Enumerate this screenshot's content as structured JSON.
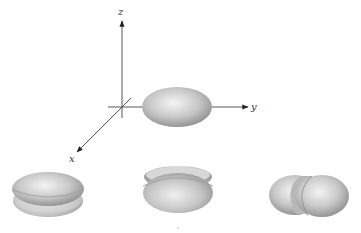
{
  "diagram": {
    "type": "3d-axes-with-ellipsoid-orbital-shapes",
    "axes": {
      "z_label": "z",
      "y_label": "y",
      "x_label": "x",
      "origin": [
        122,
        107
      ]
    },
    "main_shape": {
      "name": "ellipsoid-on-y-axis",
      "center": [
        177,
        107
      ],
      "rx": 35,
      "ry": 20
    },
    "bottom_shapes": [
      {
        "name": "split-horizontal-ellipsoid",
        "center": [
          48,
          195
        ]
      },
      {
        "name": "split-disc-ellipsoid",
        "center": [
          178,
          190
        ]
      },
      {
        "name": "split-diagonal-ellipsoid",
        "center": [
          309,
          195
        ]
      }
    ],
    "colors": {
      "shape_light": "#f2f2f2",
      "shape_dark": "#8a8a8a",
      "axis": "#333333"
    }
  }
}
